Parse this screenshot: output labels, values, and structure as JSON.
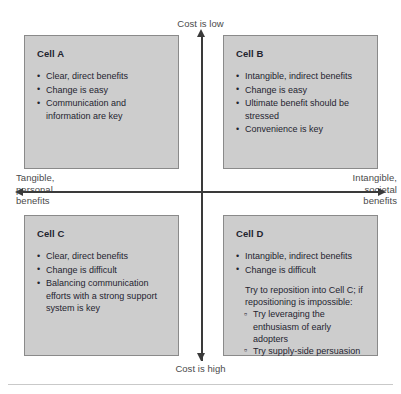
{
  "diagram": {
    "type": "2x2-matrix",
    "axes": {
      "top_label": "Cost is low",
      "bottom_label": "Cost is high",
      "left_label": "Tangible,\npersonal\nbenefits",
      "right_label": "Intangible,\nsocietal\nbenefits"
    },
    "colors": {
      "cell_fill": "#cdcdcd",
      "cell_border": "#8a8a8a",
      "text": "#1f2430",
      "axis_label_text": "#4a4a4a",
      "axis_line": "#3a3a3a",
      "background": "#ffffff"
    },
    "cells": {
      "a": {
        "title": "Cell A",
        "bullets": [
          "Clear, direct benefits",
          "Change is easy",
          "Communication and information are key"
        ]
      },
      "b": {
        "title": "Cell B",
        "bullets": [
          "Intangible, indirect benefits",
          "Change is easy",
          "Ultimate benefit should be stressed",
          "Convenience is key"
        ]
      },
      "c": {
        "title": "Cell C",
        "bullets": [
          "Clear, direct benefits",
          "Change is difficult",
          "Balancing communication efforts with a strong support system is key"
        ]
      },
      "d": {
        "title": "Cell D",
        "bullets": [
          "Intangible, indirect benefits",
          "Change is difficult"
        ],
        "note": "Try to reposition into Cell C; if repositioning is impossible:",
        "sub_bullets": [
          "Try leveraging the enthusiasm of early adopters",
          "Try supply-side persuasion"
        ]
      }
    }
  }
}
